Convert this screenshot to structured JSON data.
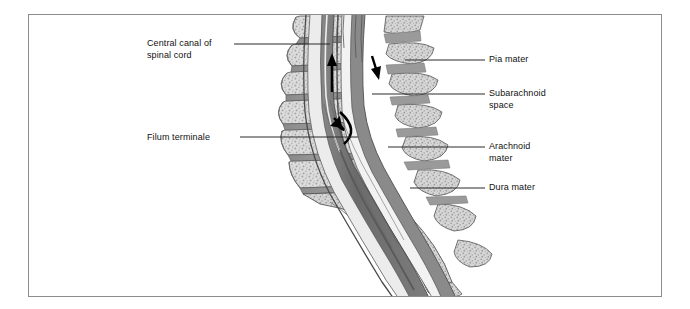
{
  "figure": {
    "type": "anatomical-illustration",
    "frame_color": "#8d8d8d",
    "background": "#ffffff"
  },
  "palette": {
    "bone_light": "#dcdcdc",
    "bone_mid": "#c4c4c4",
    "bone_speckle": "#a8a8a8",
    "disc_dark": "#8f8f8f",
    "canal_dark": "#6e6e6e",
    "dura_gray": "#7a7a7a",
    "csf_white": "#f4f4f4",
    "outline": "#4a4a4a",
    "leader_line": "#2b2b2b",
    "text": "#111111"
  },
  "labels": [
    {
      "id": "central-canal-of-spinal-cord",
      "text": "Central canal of\nspinal cord",
      "side": "left",
      "x": 147,
      "y": 38,
      "leader": {
        "x1": 234,
        "y1": 44,
        "x2": 330,
        "y2": 44
      }
    },
    {
      "id": "filum-terminale",
      "text": "Filum terminale",
      "side": "left",
      "x": 147,
      "y": 132,
      "leader": {
        "x1": 240,
        "y1": 137,
        "x2": 358,
        "y2": 137
      }
    },
    {
      "id": "pia-mater",
      "text": "Pia mater",
      "side": "right",
      "x": 489,
      "y": 54,
      "leader": {
        "x1": 405,
        "y1": 60,
        "x2": 485,
        "y2": 60
      }
    },
    {
      "id": "subarachnoid-space",
      "text": "Subarachnoid\nspace",
      "side": "right",
      "x": 489,
      "y": 88,
      "leader": {
        "x1": 372,
        "y1": 94,
        "x2": 485,
        "y2": 94
      }
    },
    {
      "id": "arachnoid-mater",
      "text": "Arachnoid\nmater",
      "side": "right",
      "x": 489,
      "y": 141,
      "leader": {
        "x1": 388,
        "y1": 147,
        "x2": 485,
        "y2": 147
      }
    },
    {
      "id": "dura-mater",
      "text": "Dura mater",
      "side": "right",
      "x": 489,
      "y": 182,
      "leader": {
        "x1": 410,
        "y1": 188,
        "x2": 485,
        "y2": 188
      }
    }
  ],
  "flow_arrows": [
    {
      "id": "ascending-csf-arrow",
      "direction": "up",
      "note": "upward arrow within the spinal canal"
    },
    {
      "id": "descending-csf-arrow",
      "direction": "down-right",
      "note": "short downward arrow at the posterior canal"
    },
    {
      "id": "curved-return-arrow",
      "direction": "hook-down",
      "note": "curved hooked arrow at the lower canal"
    }
  ],
  "structures": [
    {
      "id": "vertebral-bodies",
      "label": "Lumbar vertebral bodies",
      "count": 6
    },
    {
      "id": "intervertebral-discs",
      "label": "Intervertebral discs",
      "count": 6
    },
    {
      "id": "spinous-processes",
      "label": "Spinous processes",
      "count": 6
    },
    {
      "id": "vertebral-canal",
      "label": "Vertebral canal / dural sac"
    },
    {
      "id": "sacrum",
      "label": "Sacrum"
    },
    {
      "id": "coccyx",
      "label": "Coccyx"
    }
  ]
}
